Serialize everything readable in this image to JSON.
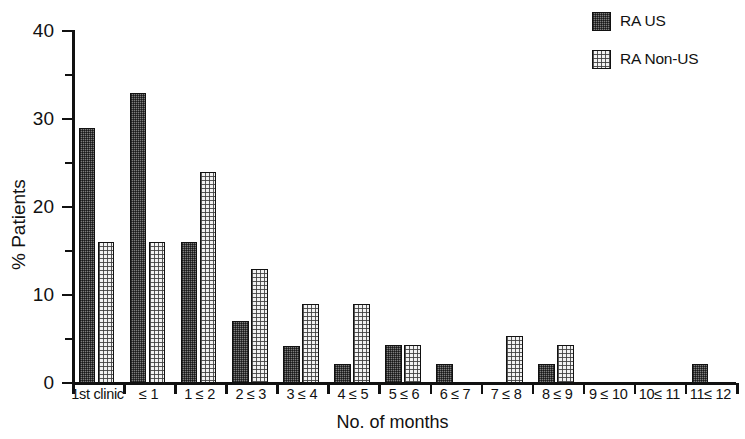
{
  "chart_data": {
    "type": "bar",
    "title": "",
    "xlabel": "No. of months",
    "ylabel": "% Patients",
    "ylim": [
      0,
      40
    ],
    "yticks": [
      0,
      10,
      20,
      30,
      40
    ],
    "yminorticks": [
      5,
      15,
      25,
      35
    ],
    "grid": false,
    "legend_position": "top-right",
    "categories": [
      "1st clinic",
      "≤ 1",
      "1 ≤ 2",
      "2 ≤ 3",
      "3 ≤ 4",
      "4 ≤ 5",
      "5 ≤ 6",
      "6 ≤ 7",
      "7 ≤ 8",
      "8 ≤ 9",
      "9 ≤ 10",
      "10≤ 11",
      "11≤ 12"
    ],
    "series": [
      {
        "name": "RA US",
        "fill": "dark-hatched",
        "color": "#7d7d7d",
        "values": [
          29,
          33,
          16,
          7,
          4.2,
          2.2,
          4.3,
          2.2,
          0,
          2.2,
          0,
          0,
          2.2
        ]
      },
      {
        "name": "RA Non-US",
        "fill": "light-dotted",
        "color": "#f2f2f2",
        "values": [
          16,
          16,
          24,
          13,
          9,
          9,
          4.3,
          0,
          5.3,
          4.3,
          0,
          0,
          0
        ]
      }
    ]
  },
  "legend": {
    "items": [
      {
        "label": "RA US",
        "swatch": "dark-hatched"
      },
      {
        "label": "RA Non-US",
        "swatch": "light-dotted"
      }
    ]
  },
  "axes": {
    "y_title": "% Patients",
    "x_title": "No. of months",
    "y_tick_labels": [
      "0",
      "10",
      "20",
      "30",
      "40"
    ]
  }
}
